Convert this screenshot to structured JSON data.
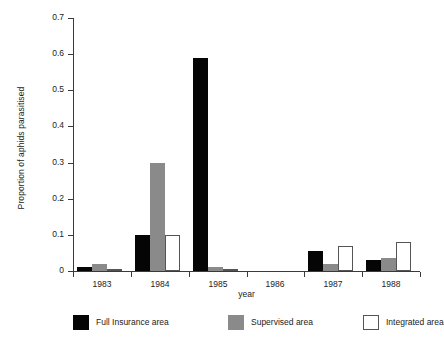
{
  "chart_data": {
    "type": "bar",
    "title": "",
    "xlabel": "year",
    "ylabel": "Proportion of aphids parasitised",
    "categories": [
      "1983",
      "1984",
      "1985",
      "1986",
      "1987",
      "1988"
    ],
    "ylim": [
      0,
      0.7
    ],
    "ytick_labels": [
      "0",
      "0.1",
      "0.2",
      "0.3",
      "0.4",
      "0.5",
      "0.6",
      "0.7"
    ],
    "ytick_values": [
      0,
      0.1,
      0.2,
      0.3,
      0.4,
      0.5,
      0.6,
      0.7
    ],
    "grid": false,
    "legend_position": "below-plot",
    "series": [
      {
        "name": "Full Insurance area",
        "color": "#050505",
        "style": "filled",
        "values": [
          0.012,
          0.1,
          0.59,
          0.0,
          0.055,
          0.03
        ]
      },
      {
        "name": "Supervised area",
        "color": "#8a8a8a",
        "style": "filled",
        "values": [
          0.018,
          0.3,
          0.01,
          0.0,
          0.02,
          0.035
        ]
      },
      {
        "name": "Integrated area",
        "color": "#ffffff",
        "style": "outlined",
        "values": [
          0.004,
          0.1,
          0.003,
          0.0,
          0.07,
          0.08
        ]
      }
    ]
  }
}
